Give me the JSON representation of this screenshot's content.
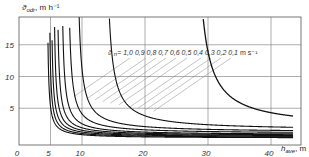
{
  "chart_data": {
    "type": "line",
    "title": "",
    "xlabel": "h_ave, m",
    "ylabel": "ϑ_odr, m h⁻¹",
    "xlim": [
      0,
      45
    ],
    "ylim": [
      0,
      19
    ],
    "grid": true,
    "x_ticks": [
      0,
      5,
      10,
      20,
      30,
      40
    ],
    "y_ticks": [
      5,
      10,
      15
    ],
    "legend_label": "ϑ n = 1,0 0,9 0,8 0,7 0,6 0,5 0,4 0,3 0,2 0,1 m s⁻¹",
    "series_param_name": "ϑ n",
    "series_unit": "m s⁻¹",
    "series": [
      {
        "name": "1,0",
        "asymptote_h": 4.4,
        "k": 3.0,
        "floor": 0.3
      },
      {
        "name": "0,9",
        "asymptote_h": 4.7,
        "k": 3.3,
        "floor": 0.4
      },
      {
        "name": "0,8",
        "asymptote_h": 5.0,
        "k": 3.8,
        "floor": 0.5
      },
      {
        "name": "0,7",
        "asymptote_h": 5.4,
        "k": 4.3,
        "floor": 0.6
      },
      {
        "name": "0,6",
        "asymptote_h": 5.9,
        "k": 5.0,
        "floor": 0.7
      },
      {
        "name": "0,5",
        "asymptote_h": 6.6,
        "k": 6.0,
        "floor": 0.8
      },
      {
        "name": "0,4",
        "asymptote_h": 7.6,
        "k": 7.5,
        "floor": 1.0
      },
      {
        "name": "0,3",
        "asymptote_h": 9.0,
        "k": 10.0,
        "floor": 1.2
      },
      {
        "name": "0,2",
        "asymptote_h": 13.5,
        "k": 15.0,
        "floor": 1.5
      },
      {
        "name": "0,1",
        "asymptote_h": 27.5,
        "k": 30.0,
        "floor": 1.9
      }
    ]
  },
  "axis": {
    "y_label_main": "ϑ",
    "y_label_sub": "odr",
    "y_label_unit": ", m h⁻¹",
    "x_label_main": "h",
    "x_label_sub": "ave",
    "x_label_unit": ", m"
  },
  "legend": {
    "prefix": "ϑ",
    "prefix_sub": "n",
    "eq": "=",
    "values": [
      "1,0",
      "0,9",
      "0,8",
      "0,7",
      "0,6",
      "0,5",
      "0,4",
      "0,3",
      "0,2",
      "0,1"
    ],
    "unit": "m s⁻¹"
  }
}
